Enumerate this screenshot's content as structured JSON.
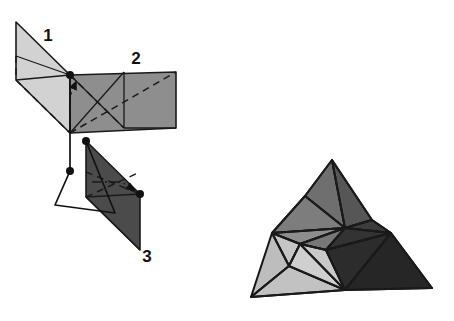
{
  "figure": {
    "background_color": "#ffffff",
    "outline_color": "#1a1a1a",
    "labels": [
      {
        "id": "label-1",
        "text": "1",
        "x": 48,
        "y": 41
      },
      {
        "id": "label-2",
        "text": "2",
        "x": 136,
        "y": 64
      },
      {
        "id": "label-3",
        "text": "3",
        "x": 147,
        "y": 262
      }
    ],
    "palette": {
      "piece_1_fill": "#d2d2d2",
      "piece_2_fill": "#8e8e8e",
      "piece_3_fill": "#4b4b4b",
      "solid_light_fill": "#cccccc",
      "solid_mid_fill": "#8a8a8a",
      "solid_dark_fill": "#3f3f3f",
      "solid_darkest_fill": "#2e2e2e",
      "line_color": "#1a1a1a",
      "dot_color": "#111111"
    },
    "net": {
      "piece_1": {
        "name": "piece-1-parallelogram",
        "fill": "#d2d2d2",
        "outline": "16,22 70,75 70,133 16,80",
        "creases": [
          "16,56 70,75",
          "16,80 70,75",
          "70,75 70,133"
        ],
        "hidden_edges": [
          "16,80 70,133",
          "16,56 16,80"
        ]
      },
      "piece_2": {
        "name": "piece-2-parallelogram",
        "fill": "#8e8e8e",
        "outline": "70,75 176,72 176,128 70,133",
        "creases": [
          "70,75 124,128",
          "124,72 124,128",
          "70,133 124,72",
          "124,128 176,128"
        ],
        "hidden_edges": [
          "70,75 124,128",
          "70,133 176,72"
        ]
      },
      "piece_3": {
        "name": "piece-3-parallelogram",
        "fill": "#4b4b4b",
        "outline": "86,141 140,194 140,250 86,197",
        "creases": [
          "86,197 140,194",
          "86,197 140,250"
        ],
        "hidden_edges": [
          "86,172 140,194",
          "86,197 140,172"
        ]
      }
    },
    "fold_arrows": [
      {
        "name": "fold-arrow-piece-2",
        "path": "70,120 70,96 76,82"
      },
      {
        "name": "fold-arrow-piece-3",
        "path": "92,182 122,182 134,190"
      }
    ],
    "leaders": [
      {
        "name": "leader-piece-1",
        "path": "70,75 70,171"
      },
      {
        "name": "leader-piece-3",
        "path": "70,171 55,205 115,213 86,141"
      }
    ],
    "vertex_dots": [
      {
        "name": "vertex-dot-top-junction",
        "x": 70,
        "y": 75,
        "r": 4.0
      },
      {
        "name": "vertex-dot-piece-1-tip",
        "x": 70,
        "y": 171,
        "r": 4.0
      },
      {
        "name": "vertex-dot-piece-3-top",
        "x": 86,
        "y": 141,
        "r": 4.0
      },
      {
        "name": "vertex-dot-piece-3-right",
        "x": 140,
        "y": 194,
        "r": 4.0
      }
    ],
    "solid": {
      "name": "assembled-polyhedron",
      "faces": [
        {
          "id": "solid-face-top-spike-left",
          "fill": "#6f6f6f",
          "points": "332,160 305,196 345,228"
        },
        {
          "id": "solid-face-top-spike-right",
          "fill": "#565656",
          "points": "332,160 345,228 372,220"
        },
        {
          "id": "solid-face-upper-left",
          "fill": "#7d7d7d",
          "points": "305,196 272,233 345,228"
        },
        {
          "id": "solid-face-upper-right",
          "fill": "#3c3c3c",
          "points": "372,220 345,228 391,233"
        },
        {
          "id": "solid-face-mid-left",
          "fill": "#8d8d8d",
          "points": "272,233 300,244 345,228"
        },
        {
          "id": "solid-face-mid-center",
          "fill": "#777777",
          "points": "300,244 326,250 345,228"
        },
        {
          "id": "solid-face-mid-right",
          "fill": "#333333",
          "points": "326,250 345,228 391,233"
        },
        {
          "id": "solid-face-left-wing-upper",
          "fill": "#c6c6c6",
          "points": "272,233 300,244 289,266"
        },
        {
          "id": "solid-face-left-wing-lower",
          "fill": "#bdbdbd",
          "points": "272,233 289,266 251,297"
        },
        {
          "id": "solid-face-left-blade",
          "fill": "#c2c2c2",
          "points": "251,297 289,266 345,290"
        },
        {
          "id": "solid-face-bottom-left",
          "fill": "#cfcfcf",
          "points": "289,266 300,244 326,250 345,290"
        },
        {
          "id": "solid-face-bottom-center",
          "fill": "#c9c9c9",
          "points": "300,244 326,250 345,290"
        },
        {
          "id": "solid-face-right-blade",
          "fill": "#2c2c2c",
          "points": "326,250 391,233 345,290"
        },
        {
          "id": "solid-face-right-wing",
          "fill": "#262626",
          "points": "391,233 432,288 345,290"
        }
      ],
      "edges": [
        "332,160 305,196",
        "332,160 345,228",
        "332,160 372,220",
        "305,196 272,233",
        "305,196 345,228",
        "372,220 345,228",
        "372,220 391,233",
        "272,233 345,228",
        "272,233 300,244",
        "300,244 345,228",
        "300,244 326,250",
        "326,250 345,228",
        "345,228 391,233",
        "272,233 289,266",
        "300,244 289,266",
        "289,266 251,297",
        "251,297 345,290",
        "289,266 345,290",
        "300,244 345,290",
        "326,250 345,290",
        "326,250 391,233",
        "391,233 345,290",
        "391,233 432,288",
        "432,288 345,290"
      ]
    }
  }
}
